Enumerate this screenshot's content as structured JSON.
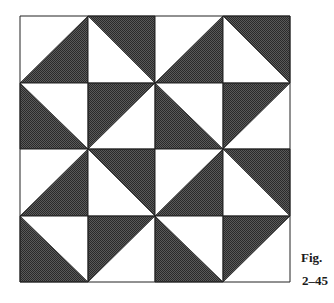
{
  "figure": {
    "caption_label": "Fig.",
    "caption_number": "2–45",
    "grid": {
      "rows": 4,
      "cols": 4,
      "x_edges": [
        20,
        88,
        155,
        223,
        290
      ],
      "y_edges": [
        16,
        83,
        149,
        216,
        282
      ]
    },
    "colors": {
      "dark": "#4a4a4a",
      "dark_alt": "#1e1e1e",
      "light": "#ffffff",
      "line": "#222222"
    },
    "cells": [
      [
        "bottom-right",
        "top-right",
        "bottom-right",
        "top-right"
      ],
      [
        "bottom-left",
        "top-left",
        "bottom-left",
        "top-left"
      ],
      [
        "bottom-right",
        "top-right",
        "bottom-right",
        "top-right"
      ],
      [
        "bottom-left",
        "top-left",
        "bottom-left",
        "top-left"
      ]
    ]
  }
}
